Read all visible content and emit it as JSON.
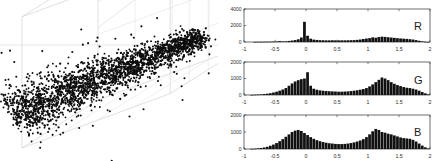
{
  "figure": {
    "title": "",
    "background": "#ffffff",
    "mark_color": "#111111",
    "axis_color": "#cccccc",
    "frame_color": "#555555"
  },
  "chart_data": [
    {
      "type": "scatter",
      "name": "rgb-3d-scatter",
      "title": "",
      "xlabel": "",
      "ylabel": "",
      "zlabel": "",
      "grid": true,
      "legend": "none",
      "projection": "3d",
      "xlim": [
        -1,
        2
      ],
      "ylim": [
        -1,
        2
      ],
      "zlim": [
        -1,
        2
      ],
      "tick_labels": [],
      "description": "Elongated cigar-shaped cloud of ~2500 black points running diagonally from lower-left to upper-right inside a light grey 3D axis box; density is highest along the central ridge with sparse outliers above and below.",
      "n_points": 2500,
      "points_seed": 7,
      "cloud": {
        "start": [
          0.06,
          0.72
        ],
        "end": [
          0.93,
          0.22
        ],
        "spread_perp": 0.055,
        "spread_along": 0.02,
        "outlier_fraction": 0.05,
        "outlier_spread": 0.16
      }
    },
    {
      "type": "bar",
      "name": "histogram-R",
      "channel_label": "R",
      "title": "",
      "xlabel": "",
      "ylabel": "",
      "grid": false,
      "legend": "none",
      "xlim": [
        -1,
        2
      ],
      "ylim": [
        0,
        4000
      ],
      "xticks": [
        -1,
        -0.5,
        0,
        0.5,
        1,
        1.5,
        2
      ],
      "xtick_labels": [
        "-1",
        "-0.5",
        "0",
        "0.5",
        "1",
        "1.5",
        "2"
      ],
      "yticks": [
        0,
        2000,
        4000
      ],
      "ytick_labels": [
        "0",
        "2000",
        "4000"
      ],
      "bin_width": 0.05,
      "bin_centers": [
        -0.975,
        -0.925,
        -0.875,
        -0.825,
        -0.775,
        -0.725,
        -0.675,
        -0.625,
        -0.575,
        -0.525,
        -0.475,
        -0.425,
        -0.375,
        -0.325,
        -0.275,
        -0.225,
        -0.175,
        -0.125,
        -0.075,
        -0.025,
        0.025,
        0.075,
        0.125,
        0.175,
        0.225,
        0.275,
        0.325,
        0.375,
        0.425,
        0.475,
        0.525,
        0.575,
        0.625,
        0.675,
        0.725,
        0.775,
        0.825,
        0.875,
        0.925,
        0.975,
        1.025,
        1.075,
        1.125,
        1.175,
        1.225,
        1.275,
        1.325,
        1.375,
        1.425,
        1.475,
        1.525,
        1.575,
        1.625,
        1.675,
        1.725,
        1.775,
        1.825,
        1.875,
        1.925,
        1.975
      ],
      "values": [
        0,
        0,
        0,
        10,
        20,
        20,
        30,
        30,
        40,
        50,
        60,
        110,
        70,
        80,
        130,
        180,
        230,
        330,
        540,
        2450,
        760,
        400,
        290,
        250,
        220,
        210,
        200,
        200,
        210,
        200,
        200,
        200,
        200,
        210,
        220,
        230,
        260,
        300,
        360,
        420,
        470,
        560,
        520,
        600,
        650,
        620,
        580,
        540,
        500,
        460,
        430,
        400,
        380,
        340,
        300,
        230,
        150,
        80,
        30,
        10
      ]
    },
    {
      "type": "bar",
      "name": "histogram-G",
      "channel_label": "G",
      "title": "",
      "xlabel": "",
      "ylabel": "",
      "grid": false,
      "legend": "none",
      "xlim": [
        -1,
        2
      ],
      "ylim": [
        0,
        2000
      ],
      "xticks": [
        -1,
        -0.5,
        0,
        0.5,
        1,
        1.5,
        2
      ],
      "xtick_labels": [
        "-1",
        "-0.5",
        "0",
        "0.5",
        "1",
        "1.5",
        "2"
      ],
      "yticks": [
        0,
        1000,
        2000
      ],
      "ytick_labels": [
        "0",
        "1000",
        "2000"
      ],
      "bin_width": 0.05,
      "bin_centers": [
        -0.975,
        -0.925,
        -0.875,
        -0.825,
        -0.775,
        -0.725,
        -0.675,
        -0.625,
        -0.575,
        -0.525,
        -0.475,
        -0.425,
        -0.375,
        -0.325,
        -0.275,
        -0.225,
        -0.175,
        -0.125,
        -0.075,
        -0.025,
        0.025,
        0.075,
        0.125,
        0.175,
        0.225,
        0.275,
        0.325,
        0.375,
        0.425,
        0.475,
        0.525,
        0.575,
        0.625,
        0.675,
        0.725,
        0.775,
        0.825,
        0.875,
        0.925,
        0.975,
        1.025,
        1.075,
        1.125,
        1.175,
        1.225,
        1.275,
        1.325,
        1.375,
        1.425,
        1.475,
        1.525,
        1.575,
        1.625,
        1.675,
        1.725,
        1.775,
        1.825,
        1.875,
        1.925,
        1.975
      ],
      "values": [
        0,
        0,
        10,
        20,
        30,
        40,
        60,
        80,
        110,
        150,
        200,
        260,
        330,
        420,
        560,
        700,
        820,
        900,
        960,
        1000,
        1380,
        560,
        380,
        320,
        280,
        260,
        240,
        230,
        220,
        210,
        200,
        200,
        210,
        220,
        240,
        260,
        290,
        320,
        360,
        420,
        520,
        640,
        780,
        920,
        1060,
        1000,
        900,
        780,
        680,
        600,
        540,
        480,
        440,
        420,
        380,
        330,
        260,
        180,
        100,
        40
      ]
    },
    {
      "type": "bar",
      "name": "histogram-B",
      "channel_label": "B",
      "title": "",
      "xlabel": "",
      "ylabel": "",
      "grid": false,
      "legend": "none",
      "xlim": [
        -1,
        2
      ],
      "ylim": [
        0,
        2000
      ],
      "xticks": [
        -1,
        -0.5,
        0,
        0.5,
        1,
        1.5,
        2
      ],
      "xtick_labels": [
        "-1",
        "-0.5",
        "0",
        "0.5",
        "1",
        "1.5",
        "2"
      ],
      "yticks": [
        0,
        1000,
        2000
      ],
      "ytick_labels": [
        "0",
        "1000",
        "2000"
      ],
      "bin_width": 0.05,
      "bin_centers": [
        -0.975,
        -0.925,
        -0.875,
        -0.825,
        -0.775,
        -0.725,
        -0.675,
        -0.625,
        -0.575,
        -0.525,
        -0.475,
        -0.425,
        -0.375,
        -0.325,
        -0.275,
        -0.225,
        -0.175,
        -0.125,
        -0.075,
        -0.025,
        0.025,
        0.075,
        0.125,
        0.175,
        0.225,
        0.275,
        0.325,
        0.375,
        0.425,
        0.475,
        0.525,
        0.575,
        0.625,
        0.675,
        0.725,
        0.775,
        0.825,
        0.875,
        0.925,
        0.975,
        1.025,
        1.075,
        1.125,
        1.175,
        1.225,
        1.275,
        1.325,
        1.375,
        1.425,
        1.475,
        1.525,
        1.575,
        1.625,
        1.675,
        1.725,
        1.775,
        1.825,
        1.875,
        1.925,
        1.975
      ],
      "values": [
        0,
        0,
        10,
        20,
        40,
        60,
        90,
        130,
        190,
        260,
        350,
        460,
        580,
        720,
        860,
        1000,
        1080,
        1120,
        1060,
        940,
        820,
        700,
        600,
        520,
        460,
        410,
        370,
        340,
        320,
        300,
        290,
        290,
        300,
        320,
        350,
        390,
        440,
        500,
        580,
        700,
        860,
        1040,
        1180,
        1120,
        1000,
        960,
        900,
        860,
        800,
        740,
        680,
        640,
        620,
        600,
        540,
        440,
        320,
        200,
        100,
        30
      ]
    }
  ]
}
